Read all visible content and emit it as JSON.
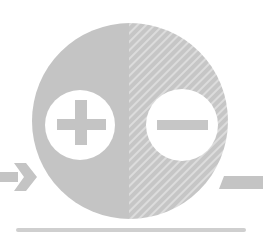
{
  "diagram": {
    "colors": {
      "background": "#ffffff",
      "fill": "#c4c4c4",
      "hatch_light": "#d9d9d9",
      "symbol_bg": "#ffffff"
    },
    "symbols": [
      {
        "name": "plus",
        "side": "left"
      },
      {
        "name": "minus",
        "side": "right"
      }
    ],
    "input_arrow": {
      "direction": "right",
      "side": "left"
    },
    "output_bar": {
      "side": "right"
    },
    "baseline": {
      "position": "bottom"
    }
  }
}
